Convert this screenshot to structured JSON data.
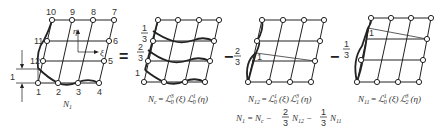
{
  "figure": {
    "panels": [
      {
        "id": "N1",
        "caption": "N",
        "caption_sub": "1",
        "node_labels": [
          "1",
          "2",
          "3",
          "4",
          "5",
          "6",
          "7",
          "8",
          "9",
          "10",
          "11",
          "12"
        ],
        "axis_labels": {
          "eta": "η",
          "xi": "ξ"
        },
        "dimension_label": "1"
      },
      {
        "id": "Nc",
        "caption": "N",
        "caption_sub": "c",
        "caption_rest": " = ℒ",
        "caption_full": "N_c = ℒ_0^3 (ξ) ℒ_0^1 (η)",
        "side_labels": [
          "1/3",
          "2/3",
          "1"
        ]
      },
      {
        "id": "N12",
        "caption_full": "N_12 = ℒ_0^1 (ξ) ℒ_1^3 (η)",
        "peak_label": "1"
      },
      {
        "id": "N11",
        "caption_full": "N_11 = ℒ_0^1 (ξ) ℒ_2^3 (η)",
        "peak_label": "1"
      }
    ],
    "operators": {
      "equals": "=",
      "minus1": "−",
      "coef1_num": "2",
      "coef1_den": "3",
      "minus2": "−",
      "coef2_num": "1",
      "coef2_den": "3"
    },
    "nc_fractions": {
      "top_num": "1",
      "top_den": "3",
      "mid_num": "2",
      "mid_den": "3",
      "bottom": "1"
    },
    "captions": {
      "n1": {
        "main": "N",
        "sub": "1"
      },
      "nc": {
        "main": "N",
        "sub": "c",
        "eq": "=",
        "L1": "ℒ",
        "L1_sup": "3",
        "L1_sub": "0",
        "arg1": "(ξ)",
        "L2": "ℒ",
        "L2_sup": "1",
        "L2_sub": "0",
        "arg2": "(η)"
      },
      "n12": {
        "main": "N",
        "sub": "12",
        "eq": "=",
        "L1": "ℒ",
        "L1_sup": "1",
        "L1_sub": "0",
        "arg1": "(ξ)",
        "L2": "ℒ",
        "L2_sup": "3",
        "L2_sub": "1",
        "arg2": "(η)"
      },
      "n11": {
        "main": "N",
        "sub": "11",
        "eq": "=",
        "L1": "ℒ",
        "L1_sup": "1",
        "L1_sub": "0",
        "arg1": "(ξ)",
        "L2": "ℒ",
        "L2_sup": "3",
        "L2_sub": "2",
        "arg2": "(η)"
      }
    },
    "formula": {
      "lhs": "N",
      "lhs_sub": "1",
      "eq": "=",
      "t1": "N",
      "t1_sub": "c",
      "m1": "−",
      "c1_num": "2",
      "c1_den": "3",
      "t2": "N",
      "t2_sub": "12",
      "m2": "−",
      "c2_num": "1",
      "c2_den": "3",
      "t3": "N",
      "t3_sub": "11"
    }
  }
}
